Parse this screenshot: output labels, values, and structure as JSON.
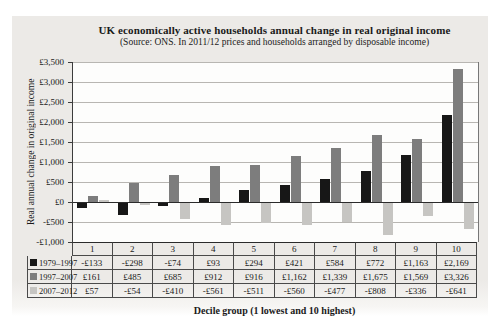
{
  "chart_data": {
    "type": "bar",
    "title": "UK economically active households annual change in real original income",
    "subtitle": "(Source: ONS. In 2011/12 prices and households arranged by disposable income)",
    "xlabel": "Decile group (1 lowest and 10 highest)",
    "ylabel": "Real annual change in original income",
    "categories": [
      "1",
      "2",
      "3",
      "4",
      "5",
      "6",
      "7",
      "8",
      "9",
      "10"
    ],
    "series": [
      {
        "name": "1979–1997",
        "color": "#171717",
        "values": [
          -133,
          -298,
          -74,
          93,
          294,
          421,
          584,
          772,
          1163,
          2169
        ],
        "labels": [
          "-£133",
          "-£298",
          "-£74",
          "£93",
          "£294",
          "£421",
          "£584",
          "£772",
          "£1,163",
          "£2,169"
        ]
      },
      {
        "name": "1997–2007",
        "color": "#7d7d7d",
        "values": [
          161,
          485,
          685,
          912,
          916,
          1162,
          1339,
          1675,
          1569,
          3326
        ],
        "labels": [
          "£161",
          "£485",
          "£685",
          "£912",
          "£916",
          "£1,162",
          "£1,339",
          "£1,675",
          "£1,569",
          "£3,326"
        ]
      },
      {
        "name": "2007–2012",
        "color": "#c6c5c2",
        "values": [
          57,
          -54,
          -410,
          -561,
          -511,
          -560,
          -477,
          -808,
          -336,
          -641
        ],
        "labels": [
          "£57",
          "-£54",
          "-£410",
          "-£561",
          "-£511",
          "-£560",
          "-£477",
          "-£808",
          "-£336",
          "-£641"
        ]
      }
    ],
    "ylim": [
      -1000,
      3500
    ],
    "y_tick_step": 500,
    "y_tick_labels": [
      "£3,500",
      "£3,000",
      "£2,500",
      "£2,000",
      "£1,500",
      "£1,000",
      "£500",
      "£0",
      "-£500",
      "-£1,000"
    ],
    "grid": true,
    "legend_position": "table-left-column"
  }
}
